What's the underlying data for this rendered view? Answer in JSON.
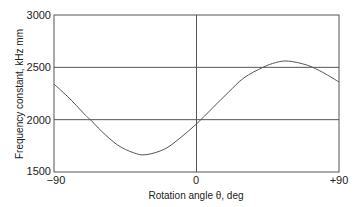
{
  "chart_data": {
    "type": "line",
    "title": "",
    "xlabel": "Rotation angle θ, deg",
    "ylabel": "Frequency constant, kHz mm",
    "xlim": [
      -90,
      90
    ],
    "ylim": [
      1500,
      3000
    ],
    "x_ticks": [
      "−90",
      "0",
      "+90"
    ],
    "y_ticks": [
      "1500",
      "2000",
      "2500",
      "3000"
    ],
    "grid": {
      "horizontal": [
        2000,
        2500
      ],
      "vertical": [
        0
      ]
    },
    "legend": null,
    "series": [
      {
        "name": "Frequency constant",
        "x": [
          -90,
          -80,
          -70,
          -67,
          -60,
          -50,
          -40,
          -32,
          -20,
          -10,
          0,
          10,
          20,
          30,
          42,
          50,
          58,
          70,
          80,
          90
        ],
        "values": [
          2340,
          2200,
          2040,
          2000,
          1890,
          1760,
          1685,
          1665,
          1720,
          1830,
          1960,
          2110,
          2260,
          2400,
          2500,
          2545,
          2560,
          2520,
          2450,
          2360
        ]
      }
    ]
  }
}
